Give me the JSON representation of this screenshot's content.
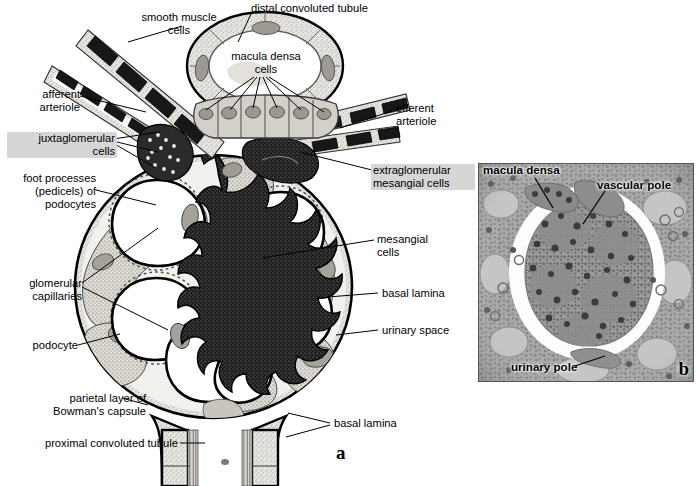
{
  "figure": {
    "panel_a_letter": "a",
    "panel_b_letter": "b",
    "background_color": "#ffffff"
  },
  "diagram_labels": [
    {
      "id": "smooth-muscle-cells",
      "text": "smooth muscle\ncells",
      "highlight": false
    },
    {
      "id": "distal-convoluted-tubule",
      "text": "distal convoluted tubule",
      "highlight": false
    },
    {
      "id": "macula-densa-cells",
      "text": "macula densa\ncells",
      "highlight": false
    },
    {
      "id": "afferent-arteriole",
      "text": "afferent\narteriole",
      "highlight": false
    },
    {
      "id": "efferent-arteriole",
      "text": "efferent\narteriole",
      "highlight": false
    },
    {
      "id": "juxtaglomerular-cells",
      "text": "juxtaglomerular\ncells",
      "highlight": true
    },
    {
      "id": "extraglomerular-mesangial-cells",
      "text": "extraglomerular\nmesangial cells",
      "highlight": true
    },
    {
      "id": "foot-processes-podocytes",
      "text": "foot processes\n(pedicels) of\npodocytes",
      "highlight": false
    },
    {
      "id": "mesangial-cells",
      "text": "mesangial\ncells",
      "highlight": false
    },
    {
      "id": "glomerular-capillaries",
      "text": "glomerular\ncapillaries",
      "highlight": false
    },
    {
      "id": "basal-lamina-right",
      "text": "basal lamina",
      "highlight": false
    },
    {
      "id": "urinary-space",
      "text": "urinary space",
      "highlight": false
    },
    {
      "id": "podocyte",
      "text": "podocyte",
      "highlight": false
    },
    {
      "id": "parietal-layer-bowmans-capsule",
      "text": "parietal layer of\nBowman's capsule",
      "highlight": false
    },
    {
      "id": "basal-lamina-bottom",
      "text": "basal lamina",
      "highlight": false
    },
    {
      "id": "proximal-convoluted-tubule",
      "text": "proximal convoluted tubule",
      "highlight": false
    }
  ],
  "photo_labels": [
    {
      "id": "macula-densa",
      "text": "macula densa"
    },
    {
      "id": "vascular-pole",
      "text": "vascular pole"
    },
    {
      "id": "urinary-pole",
      "text": "urinary pole"
    }
  ],
  "colors": {
    "ink": "#000000",
    "highlight": "#d6d6d6",
    "capsule_fill": "#e8e6e1",
    "cytoplasm": "#d9d6cf",
    "nucleus": "#a9a6a0",
    "dark_cell": "#242424",
    "photo_base": "#9b9b9b"
  }
}
